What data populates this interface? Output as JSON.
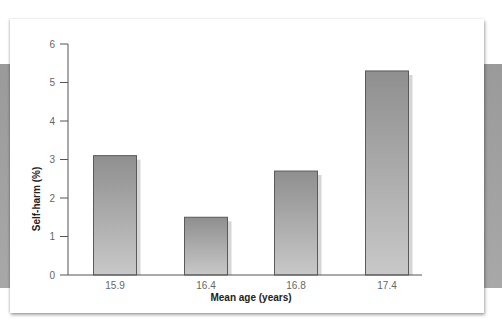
{
  "chart_data": {
    "type": "bar",
    "title": "",
    "xlabel": "Mean age (years)",
    "ylabel": "Self-harm (%)",
    "categories": [
      "15.9",
      "16.4",
      "16.8",
      "17.4"
    ],
    "values": [
      3.1,
      1.5,
      2.7,
      5.3
    ],
    "ylim": [
      0,
      6
    ],
    "yticks": [
      0,
      1,
      2,
      3,
      4,
      5,
      6
    ],
    "grid": false,
    "legend": null,
    "colors": {
      "bar_top": "#8f8f8f",
      "bar_bottom": "#c8c8c8",
      "bar_shadow": "#d6d6d6",
      "axis": "#555555"
    }
  }
}
